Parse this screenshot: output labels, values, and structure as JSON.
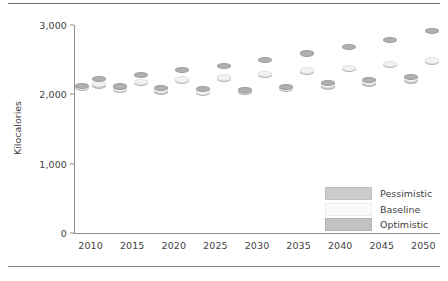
{
  "figure": {
    "background": "#ffffff",
    "top_rule": true,
    "bottom_rule": true
  },
  "legend": {
    "position": "inside-bottom-right",
    "items": [
      {
        "label": "Pessimistic",
        "color": "#cccccc",
        "key": "pessimistic"
      },
      {
        "label": "Baseline",
        "color": "#fbfbfb",
        "key": "baseline"
      },
      {
        "label": "Optimistic",
        "color": "#c2c2c2",
        "key": "optimistic"
      }
    ]
  },
  "chart_data": {
    "type": "scatter",
    "title": "",
    "subtitle": "",
    "xlabel": "",
    "ylabel": "Kilocalories",
    "xlim": [
      2008,
      2052
    ],
    "ylim": [
      0,
      3000
    ],
    "grid": false,
    "legend_position": "inside-bottom-right",
    "ytick_labels": [
      "0",
      "1,000",
      "2,000",
      "3,000"
    ],
    "ytick_values": [
      0,
      1000,
      2000,
      3000
    ],
    "xtick_labels": [
      "2010",
      "2015",
      "2020",
      "2025",
      "2030",
      "2035",
      "2040",
      "2045",
      "2050"
    ],
    "xtick_values": [
      2010,
      2015,
      2020,
      2025,
      2030,
      2035,
      2040,
      2045,
      2050
    ],
    "x": [
      2009,
      2011,
      2013.5,
      2016,
      2018.5,
      2021,
      2023.5,
      2026,
      2028.5,
      2031,
      2033.5,
      2036,
      2038.5,
      2041,
      2043.5,
      2046,
      2048.5,
      2051
    ],
    "series": [
      {
        "name": "Pessimistic",
        "color": "#c9c9c9",
        "values": [
          2090,
          2130,
          2060,
          2170,
          2040,
          2200,
          2015,
          2225,
          2040,
          2275,
          2075,
          2325,
          2115,
          2365,
          2155,
          2420,
          2200,
          2470
        ]
      },
      {
        "name": "Baseline",
        "color": "#f3f3f3",
        "values": [
          2110,
          2150,
          2085,
          2185,
          2060,
          2215,
          2035,
          2245,
          2060,
          2290,
          2095,
          2345,
          2135,
          2385,
          2175,
          2440,
          2220,
          2490
        ]
      },
      {
        "name": "Optimistic",
        "color": "#b0b0b0",
        "values": [
          2120,
          2220,
          2115,
          2275,
          2090,
          2355,
          2075,
          2415,
          2065,
          2500,
          2110,
          2590,
          2160,
          2685,
          2205,
          2790,
          2250,
          2915
        ]
      }
    ]
  }
}
